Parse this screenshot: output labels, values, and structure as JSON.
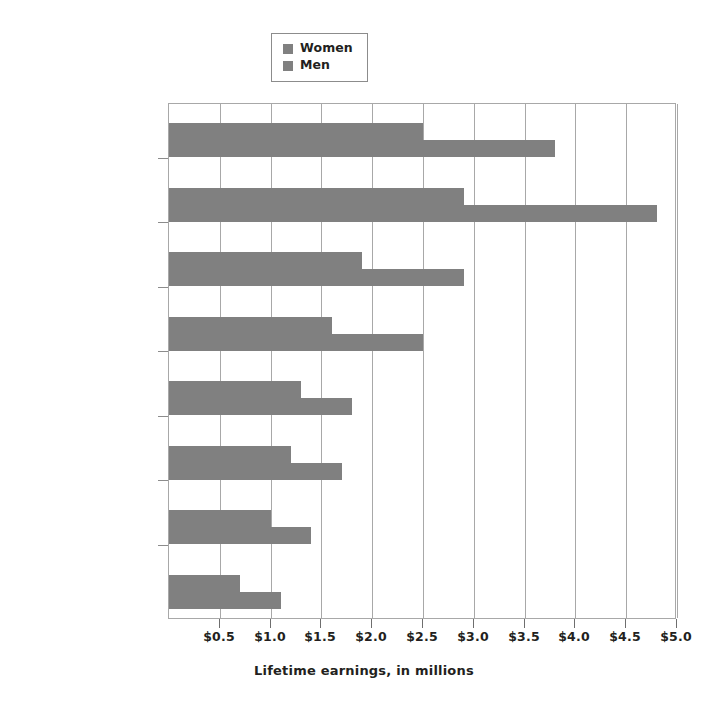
{
  "chart_data": {
    "type": "bar",
    "orientation": "horizontal",
    "title": "",
    "xlabel": "Lifetime earnings, in millions",
    "ylabel": "",
    "xlim": [
      0,
      5.0
    ],
    "xticks": [
      0.5,
      1.0,
      1.5,
      2.0,
      2.5,
      3.0,
      3.5,
      4.0,
      4.5,
      5.0
    ],
    "xtick_labels": [
      "$0.5",
      "$1.0",
      "$1.5",
      "$2.0",
      "$2.5",
      "$3.0",
      "$3.5",
      "$4.0",
      "$4.5",
      "$5.0"
    ],
    "grid": true,
    "legend_position": "top-center",
    "categories": [
      "Doctorate",
      "Professional degree",
      "Master's degree",
      "Bachelor's degree",
      "Associate degree",
      "Some college",
      "High school diploma",
      "No high school diploma"
    ],
    "series": [
      {
        "name": "Women",
        "color": "#808080",
        "values": [
          2.5,
          2.9,
          1.9,
          1.6,
          1.3,
          1.2,
          1.0,
          0.7
        ]
      },
      {
        "name": "Men",
        "color": "#808080",
        "values": [
          3.8,
          4.8,
          2.9,
          2.5,
          1.8,
          1.7,
          1.4,
          1.1
        ]
      }
    ]
  },
  "legend": {
    "entries": [
      {
        "label": "Women",
        "swatch_color": "#808080"
      },
      {
        "label": "Men",
        "swatch_color": "#808080"
      }
    ]
  },
  "axis": {
    "title": "Lifetime earnings, in millions"
  },
  "colors": {
    "bar": "#808080",
    "grid": "#a8a8a8",
    "text": "#231f20",
    "background": "#ffffff"
  }
}
